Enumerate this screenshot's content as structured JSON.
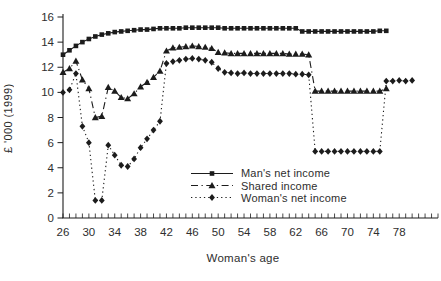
{
  "chart_data": {
    "type": "line",
    "title": "",
    "xlabel": "Woman's age",
    "ylabel": "£ '000 (1999)",
    "xlim": [
      26,
      84
    ],
    "ylim": [
      0,
      16
    ],
    "x_major_ticks": [
      26,
      30,
      34,
      38,
      42,
      46,
      50,
      54,
      58,
      62,
      66,
      70,
      74,
      78
    ],
    "x_minor_tick_step": 1,
    "y_ticks": [
      0,
      2,
      4,
      6,
      8,
      10,
      12,
      14,
      16
    ],
    "grid": "off",
    "legend_position": "inside lower right of plot",
    "ink_color": "#1c1c1c",
    "series": [
      {
        "name": "Man's net income",
        "marker": "square",
        "line": "solid",
        "x": [
          26,
          27,
          28,
          29,
          30,
          31,
          32,
          33,
          34,
          35,
          36,
          37,
          38,
          39,
          40,
          41,
          42,
          43,
          44,
          45,
          46,
          47,
          48,
          49,
          50,
          51,
          52,
          53,
          54,
          55,
          56,
          57,
          58,
          59,
          60,
          61,
          62,
          63,
          64,
          65,
          66,
          67,
          68,
          69,
          70,
          71,
          72,
          73,
          74,
          75,
          76
        ],
        "values": [
          13.0,
          13.35,
          13.7,
          14.0,
          14.25,
          14.45,
          14.6,
          14.7,
          14.8,
          14.85,
          14.9,
          14.95,
          15.0,
          15.0,
          15.05,
          15.1,
          15.1,
          15.1,
          15.1,
          15.15,
          15.15,
          15.15,
          15.15,
          15.15,
          15.15,
          15.1,
          15.1,
          15.1,
          15.1,
          15.1,
          15.1,
          15.1,
          15.1,
          15.1,
          15.1,
          15.1,
          15.1,
          14.85,
          14.85,
          14.85,
          14.85,
          14.85,
          14.85,
          14.85,
          14.85,
          14.85,
          14.85,
          14.85,
          14.85,
          14.9,
          14.9
        ]
      },
      {
        "name": "Shared income",
        "marker": "triangle",
        "line": "dashdot",
        "x": [
          26,
          27,
          28,
          29,
          30,
          31,
          32,
          33,
          34,
          35,
          36,
          37,
          38,
          39,
          40,
          41,
          42,
          43,
          44,
          45,
          46,
          47,
          48,
          49,
          50,
          51,
          52,
          53,
          54,
          55,
          56,
          57,
          58,
          59,
          60,
          61,
          62,
          63,
          64,
          65,
          66,
          67,
          68,
          69,
          70,
          71,
          72,
          73,
          74,
          75,
          76
        ],
        "values": [
          11.6,
          11.9,
          12.5,
          11.0,
          10.3,
          8.0,
          8.1,
          10.4,
          10.1,
          9.6,
          9.5,
          9.9,
          10.45,
          10.8,
          11.2,
          11.7,
          13.3,
          13.55,
          13.6,
          13.65,
          13.7,
          13.65,
          13.6,
          13.5,
          13.2,
          13.15,
          13.1,
          13.1,
          13.1,
          13.1,
          13.1,
          13.1,
          13.1,
          13.1,
          13.1,
          13.05,
          13.05,
          13.05,
          13.0,
          10.1,
          10.1,
          10.1,
          10.1,
          10.1,
          10.1,
          10.1,
          10.1,
          10.1,
          10.1,
          10.1,
          10.3
        ]
      },
      {
        "name": "Woman's net income",
        "marker": "diamond",
        "line": "dotted",
        "x": [
          26,
          27,
          28,
          29,
          30,
          31,
          32,
          33,
          34,
          35,
          36,
          37,
          38,
          39,
          40,
          41,
          42,
          43,
          44,
          45,
          46,
          47,
          48,
          49,
          50,
          51,
          52,
          53,
          54,
          55,
          56,
          57,
          58,
          59,
          60,
          61,
          62,
          63,
          64,
          65,
          66,
          67,
          68,
          69,
          70,
          71,
          72,
          73,
          74,
          75,
          76,
          77,
          78,
          79,
          80
        ],
        "values": [
          10.0,
          10.2,
          11.5,
          7.3,
          6.0,
          1.4,
          1.4,
          5.8,
          5.0,
          4.2,
          4.1,
          4.7,
          5.6,
          6.3,
          7.0,
          7.7,
          12.3,
          12.45,
          12.55,
          12.65,
          12.7,
          12.65,
          12.55,
          12.4,
          11.9,
          11.6,
          11.55,
          11.5,
          11.55,
          11.5,
          11.5,
          11.5,
          11.5,
          11.5,
          11.5,
          11.5,
          11.45,
          11.45,
          11.4,
          5.3,
          5.3,
          5.3,
          5.3,
          5.3,
          5.3,
          5.3,
          5.3,
          5.3,
          5.3,
          5.3,
          10.9,
          10.9,
          10.95,
          10.9,
          10.95
        ]
      }
    ]
  }
}
